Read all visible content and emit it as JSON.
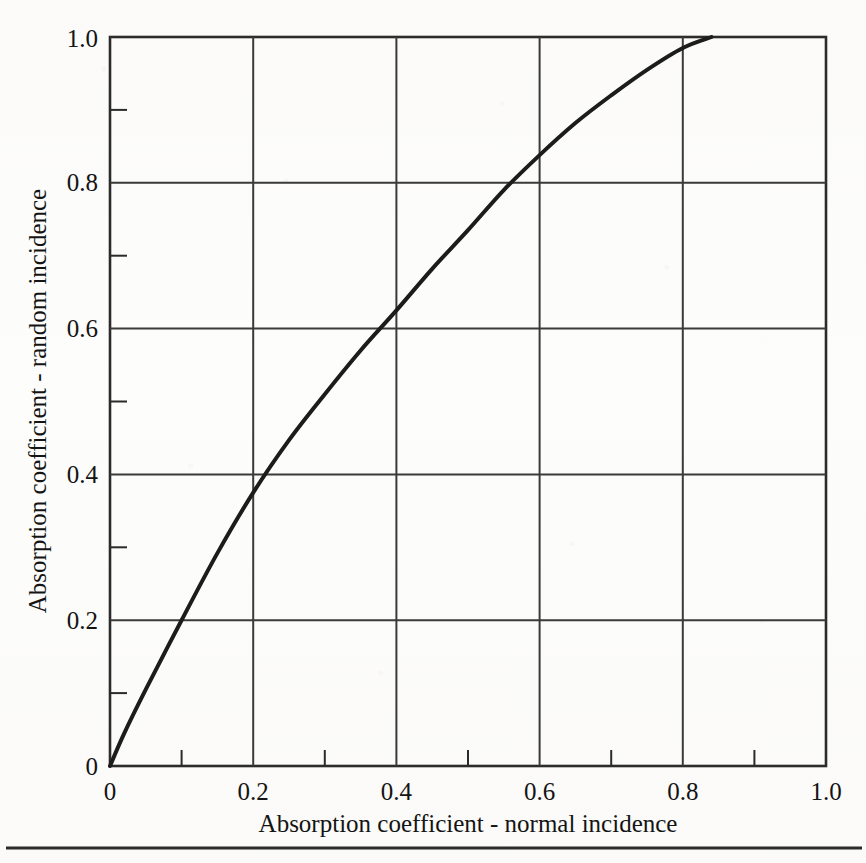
{
  "figure": {
    "background_color": "#fdfdfc",
    "ink_color": "#222222",
    "footer_rule": true
  },
  "chart_data": {
    "type": "line",
    "title": "",
    "xlabel": "Absorption coefficient - normal incidence",
    "ylabel": "Absorption coefficient - random incidence",
    "xlim": [
      0,
      1.0
    ],
    "ylim": [
      0,
      1.0
    ],
    "grid": true,
    "grid_major_step": 0.2,
    "minor_tick_step": 0.1,
    "legend": "none",
    "x_tick_labels": [
      "0",
      "0.2",
      "0.4",
      "0.6",
      "0.8",
      "1.0"
    ],
    "x_tick_values": [
      0,
      0.2,
      0.4,
      0.6,
      0.8,
      1.0
    ],
    "y_tick_labels": [
      "0",
      "0.2",
      "0.4",
      "0.6",
      "0.8",
      "1.0"
    ],
    "y_tick_values": [
      0,
      0.2,
      0.4,
      0.6,
      0.8,
      1.0
    ],
    "series": [
      {
        "name": "normal-to-random incidence conversion",
        "color": "#1c1c1c",
        "line_width": 4,
        "x": [
          0,
          0.02,
          0.05,
          0.1,
          0.15,
          0.2,
          0.25,
          0.3,
          0.35,
          0.4,
          0.45,
          0.5,
          0.55,
          0.6,
          0.65,
          0.7,
          0.75,
          0.8,
          0.84
        ],
        "y": [
          0,
          0.045,
          0.105,
          0.2,
          0.292,
          0.375,
          0.447,
          0.51,
          0.57,
          0.625,
          0.682,
          0.735,
          0.79,
          0.838,
          0.882,
          0.92,
          0.955,
          0.985,
          1.0
        ]
      }
    ]
  }
}
